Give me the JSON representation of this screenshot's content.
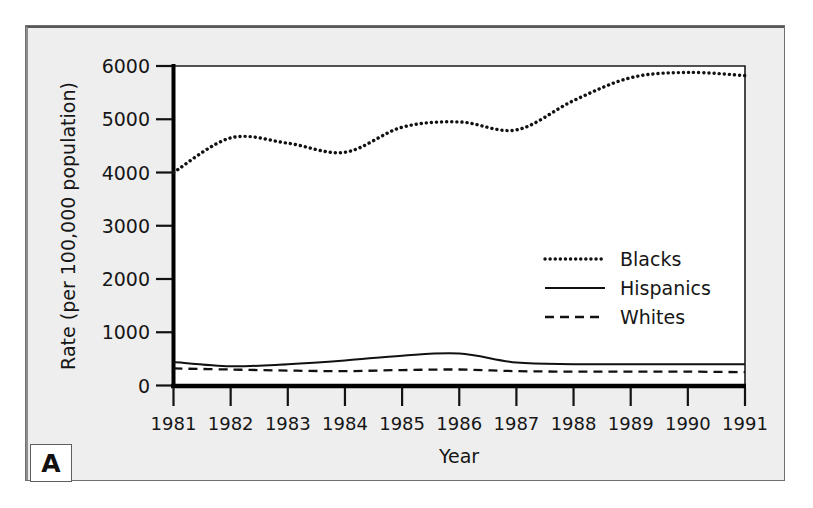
{
  "figure": {
    "panel_label": "A",
    "background_color": "#eeeeee",
    "plot_background_color": "#ffffff",
    "frame_border_color": "#6f6f6f"
  },
  "chart_data": {
    "type": "line",
    "title": "",
    "xlabel": "Year",
    "ylabel": "Rate (per 100,000 population)",
    "x": [
      1981,
      1982,
      1983,
      1984,
      1985,
      1986,
      1987,
      1988,
      1989,
      1990,
      1991
    ],
    "xtick_labels": [
      "1981",
      "1982",
      "1983",
      "1984",
      "1985",
      "1986",
      "1987",
      "1988",
      "1989",
      "1990",
      "1991"
    ],
    "ytick_labels": [
      "0",
      "1000",
      "2000",
      "3000",
      "4000",
      "5000",
      "6000"
    ],
    "yticks": [
      0,
      1000,
      2000,
      3000,
      4000,
      5000,
      6000
    ],
    "xlim": [
      1981,
      1991
    ],
    "ylim": [
      0,
      6000
    ],
    "grid": false,
    "legend_position": "center-right",
    "series": [
      {
        "name": "Blacks",
        "line_style": "dotted",
        "color": "#111111",
        "values": [
          4000,
          4650,
          4550,
          4380,
          4850,
          4950,
          4800,
          5350,
          5780,
          5880,
          5820
        ]
      },
      {
        "name": "Hispanics",
        "line_style": "solid",
        "color": "#111111",
        "values": [
          440,
          360,
          400,
          470,
          560,
          600,
          430,
          400,
          400,
          400,
          400
        ]
      },
      {
        "name": "Whites",
        "line_style": "dashed",
        "color": "#111111",
        "values": [
          320,
          300,
          280,
          270,
          290,
          300,
          270,
          260,
          260,
          260,
          250
        ]
      }
    ]
  },
  "legend": {
    "items": [
      {
        "label": "Blacks",
        "style": "dotted"
      },
      {
        "label": "Hispanics",
        "style": "solid"
      },
      {
        "label": "Whites",
        "style": "dashed"
      }
    ]
  }
}
